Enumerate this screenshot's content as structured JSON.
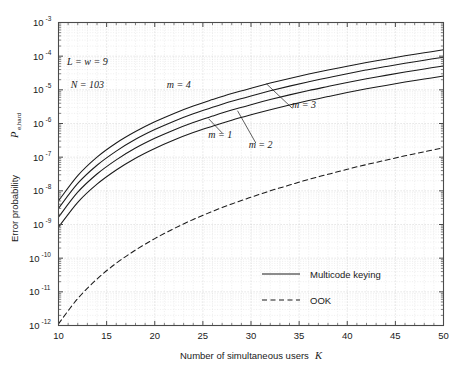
{
  "chart_data": {
    "type": "line",
    "title": "",
    "xlabel": "Number of simultaneous users   K",
    "xlabel_text": "Number of simultaneous users",
    "xlabel_symbol": "K",
    "ylabel_text": "Error probability",
    "ylabel_symbol": "P",
    "ylabel_subscript": "e,hard",
    "xlim": [
      10,
      50
    ],
    "ylim": [
      1e-12,
      0.001
    ],
    "yscale": "log",
    "xscale": "linear",
    "grid": true,
    "grid_minor": true,
    "xticks": [
      10,
      15,
      20,
      25,
      30,
      35,
      40,
      45,
      50
    ],
    "xtick_labels": [
      "10",
      "15",
      "20",
      "25",
      "30",
      "35",
      "40",
      "45",
      "50"
    ],
    "yticks": [
      -3,
      -4,
      -5,
      -6,
      -7,
      -8,
      -9,
      -10,
      -11,
      -12
    ],
    "ytick_labels": [
      "10⁻³",
      "10⁻⁴",
      "10⁻⁵",
      "10⁻⁶",
      "10⁻⁷",
      "10⁻⁸",
      "10⁻⁹",
      "10⁻¹⁰",
      "10⁻¹¹",
      "10⁻¹²"
    ],
    "ytick_mantissa": "10",
    "ytick_exponents": [
      "-3",
      "-4",
      "-5",
      "-6",
      "-7",
      "-8",
      "-9",
      "-10",
      "-11",
      "-12"
    ],
    "legend_position": "lower right",
    "legend": [
      {
        "label": "Multicode keying",
        "style": "solid"
      },
      {
        "label": "OOK",
        "style": "dashed"
      }
    ],
    "annotations": [
      {
        "text": "L = w = 9",
        "x": 13.0,
        "y_log": -4.25
      },
      {
        "text": "N = 103",
        "x": 13.0,
        "y_log": -4.95
      },
      {
        "text": "m = 4",
        "x": 22.5,
        "y_log": -4.95
      },
      {
        "text": "m = 3",
        "x": 35.5,
        "y_log": -5.55
      },
      {
        "text": "m = 1",
        "x": 26.8,
        "y_log": -6.42
      },
      {
        "text": "m = 2",
        "x": 31.0,
        "y_log": -6.72
      }
    ],
    "series": [
      {
        "name": "m = 4",
        "style": "solid",
        "color": "#1a1a1a",
        "x": [
          10,
          12,
          14,
          16,
          18,
          20,
          22,
          24,
          26,
          28,
          30,
          32,
          34,
          36,
          38,
          40,
          42,
          44,
          46,
          48,
          50
        ],
        "y_log10": [
          -8.3,
          -7.55,
          -7.0,
          -6.58,
          -6.24,
          -5.95,
          -5.7,
          -5.48,
          -5.29,
          -5.11,
          -4.95,
          -4.8,
          -4.66,
          -4.53,
          -4.41,
          -4.3,
          -4.19,
          -4.09,
          -3.99,
          -3.9,
          -3.81
        ]
      },
      {
        "name": "m = 3",
        "style": "solid",
        "color": "#1a1a1a",
        "x": [
          10,
          12,
          14,
          16,
          18,
          20,
          22,
          24,
          26,
          28,
          30,
          32,
          34,
          36,
          38,
          40,
          42,
          44,
          46,
          48,
          50
        ],
        "y_log10": [
          -8.52,
          -7.78,
          -7.24,
          -6.82,
          -6.47,
          -6.18,
          -5.93,
          -5.71,
          -5.52,
          -5.34,
          -5.18,
          -5.03,
          -4.89,
          -4.76,
          -4.64,
          -4.52,
          -4.41,
          -4.31,
          -4.21,
          -4.12,
          -4.03
        ]
      },
      {
        "name": "m = 2",
        "style": "solid",
        "color": "#1a1a1a",
        "x": [
          10,
          12,
          14,
          16,
          18,
          20,
          22,
          24,
          26,
          28,
          30,
          32,
          34,
          36,
          38,
          40,
          42,
          44,
          46,
          48,
          50
        ],
        "y_log10": [
          -8.78,
          -8.04,
          -7.5,
          -7.08,
          -6.73,
          -6.44,
          -6.19,
          -5.97,
          -5.78,
          -5.6,
          -5.44,
          -5.29,
          -5.15,
          -5.02,
          -4.9,
          -4.78,
          -4.67,
          -4.57,
          -4.47,
          -4.38,
          -4.29
        ]
      },
      {
        "name": "m = 1",
        "style": "solid",
        "color": "#1a1a1a",
        "x": [
          10,
          12,
          14,
          16,
          18,
          20,
          22,
          24,
          26,
          28,
          30,
          32,
          34,
          36,
          38,
          40,
          42,
          44,
          46,
          48,
          50
        ],
        "y_log10": [
          -9.08,
          -8.34,
          -7.8,
          -7.38,
          -7.03,
          -6.74,
          -6.49,
          -6.27,
          -6.08,
          -5.9,
          -5.74,
          -5.59,
          -5.45,
          -5.32,
          -5.2,
          -5.08,
          -4.97,
          -4.87,
          -4.77,
          -4.68,
          -4.59
        ]
      },
      {
        "name": "OOK",
        "style": "dashed",
        "color": "#1a1a1a",
        "x": [
          10,
          12,
          14,
          16,
          18,
          20,
          22,
          24,
          26,
          28,
          30,
          32,
          34,
          36,
          38,
          40,
          42,
          44,
          46,
          48,
          50
        ],
        "y_log10": [
          -11.95,
          -11.2,
          -10.62,
          -10.15,
          -9.76,
          -9.42,
          -9.12,
          -8.85,
          -8.61,
          -8.39,
          -8.19,
          -8.0,
          -7.83,
          -7.66,
          -7.51,
          -7.36,
          -7.22,
          -7.09,
          -6.96,
          -6.84,
          -6.72
        ]
      }
    ]
  },
  "style": {
    "axis_color": "#4a4a4a",
    "grid_color": "#c8c8c8",
    "minor_grid_color": "#dcdcdc",
    "line_color": "#1a1a1a",
    "background": "#ffffff"
  }
}
